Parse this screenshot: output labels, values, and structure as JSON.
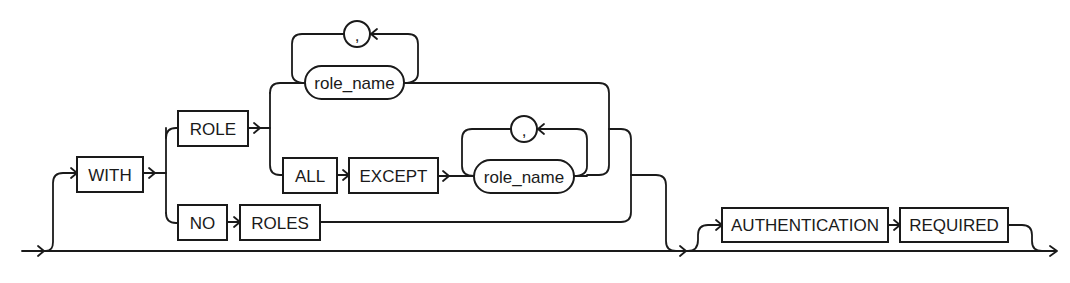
{
  "diagram": {
    "type": "syntax-railroad",
    "keywords": {
      "with": "WITH",
      "role": "ROLE",
      "all": "ALL",
      "except": "EXCEPT",
      "no": "NO",
      "roles": "ROLES",
      "authentication": "AUTHENTICATION",
      "required": "REQUIRED"
    },
    "variables": {
      "role_name_1": "role_name",
      "role_name_2": "role_name"
    },
    "separators": {
      "comma_1": ",",
      "comma_2": ","
    },
    "colors": {
      "stroke": "#1a1a1a",
      "background": "#ffffff"
    }
  }
}
